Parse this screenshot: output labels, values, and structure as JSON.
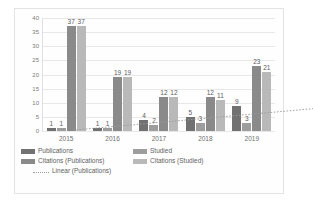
{
  "chart_data": {
    "type": "bar",
    "title": "",
    "xlabel": "",
    "ylabel": "",
    "categories": [
      "2015",
      "2016",
      "2017",
      "2018",
      "2019"
    ],
    "ylim": [
      0,
      40
    ],
    "yticks": [
      0,
      5,
      10,
      15,
      20,
      25,
      30,
      35,
      40
    ],
    "grid": true,
    "legend_position": "bottom",
    "series": [
      {
        "name": "Publications",
        "values": [
          1,
          1,
          4,
          5,
          9
        ],
        "color": "#717171",
        "type": "bar"
      },
      {
        "name": "Studied",
        "values": [
          1,
          1,
          2,
          3,
          3
        ],
        "color": "#9d9d9d",
        "type": "bar"
      },
      {
        "name": "Citations (Publications)",
        "values": [
          37,
          19,
          12,
          12,
          23
        ],
        "color": "#8a8a8a",
        "type": "bar"
      },
      {
        "name": "Citations (Studied)",
        "values": [
          37,
          19,
          12,
          11,
          21
        ],
        "color": "#b9b9b9",
        "type": "bar"
      },
      {
        "name": "Linear (Publications)",
        "values": [
          0.3,
          2.2,
          4.1,
          6.0,
          7.9
        ],
        "color": "#9a9a9a",
        "type": "line",
        "style": "dotted"
      }
    ],
    "data_labels": [
      [
        "1",
        "1",
        "37",
        "37"
      ],
      [
        "1",
        "1",
        "19",
        "19"
      ],
      [
        "4",
        "2",
        "12",
        "12"
      ],
      [
        "5",
        "3",
        "12",
        "11"
      ],
      [
        "9",
        "3",
        "23",
        "21"
      ]
    ]
  },
  "legend": {
    "rows": [
      [
        {
          "label": "Publications",
          "swatch": "s0"
        },
        {
          "label": "Studied",
          "swatch": "s1"
        }
      ],
      [
        {
          "label": "Citations (Publications)",
          "swatch": "s2"
        },
        {
          "label": "Citations (Studied)",
          "swatch": "s3"
        }
      ],
      [
        {
          "label": "Linear (Publications)",
          "swatch": "line"
        }
      ]
    ]
  }
}
